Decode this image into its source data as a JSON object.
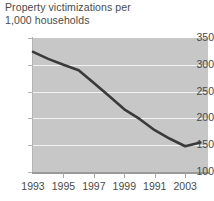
{
  "chart_data": {
    "type": "line",
    "title": "Property victimizations per\n1,000 households",
    "title_line1": "Property victimizations per",
    "title_line2": "1,000 households",
    "xlabel": "",
    "ylabel": "",
    "ylim": [
      100,
      350
    ],
    "xlim": [
      1993,
      2004.5
    ],
    "yticks": [
      350,
      300,
      250,
      200,
      150,
      100
    ],
    "ytick_labels": [
      "350",
      "300",
      "250",
      "200",
      "150",
      "100"
    ],
    "xtick_labels": [
      "1993",
      "1995",
      "1997",
      "1999",
      "1991",
      "2003"
    ],
    "xtick_values": [
      1993,
      1995,
      1997,
      1999,
      2001,
      2003
    ],
    "grid": true,
    "grid_color": "#f2f2f2",
    "legend": null,
    "plot_background": "#c7c7c7",
    "page_background": "#ffffff",
    "line_color": "#3a3a3a",
    "text_color": "#4a4a4a",
    "x": [
      1993,
      1994,
      1995,
      1996,
      1997,
      1998,
      1999,
      2000,
      2001,
      2002,
      2003,
      2004
    ],
    "values": [
      324,
      311,
      300,
      290,
      266,
      242,
      217,
      199,
      178,
      162,
      148,
      155
    ],
    "series": [
      {
        "name": "Property victimizations per 1,000 households",
        "values": [
          324,
          311,
          300,
          290,
          266,
          242,
          217,
          199,
          178,
          162,
          148,
          155
        ]
      }
    ]
  }
}
